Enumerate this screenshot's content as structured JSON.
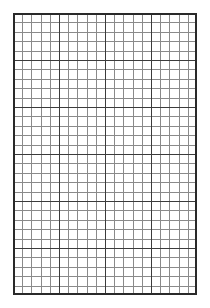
{
  "page": {
    "type": "graph-paper",
    "background_color": "#ffffff"
  },
  "grid": {
    "columns": 20,
    "rows": 30,
    "major_every": 5,
    "major_columns": 4,
    "major_rows": 6,
    "minor_line_color": "#8a8a8a",
    "major_line_color": "#3c3c3c",
    "border_color": "#2a2a2a"
  }
}
